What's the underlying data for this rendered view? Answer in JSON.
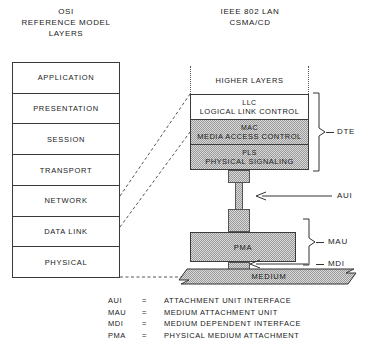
{
  "osi": {
    "title": "OSI\nREFERENCE MODEL\nLAYERS",
    "layers": [
      {
        "label": "APPLICATION"
      },
      {
        "label": "PRESENTATION"
      },
      {
        "label": "SESSION"
      },
      {
        "label": "TRANSPORT"
      },
      {
        "label": "NETWORK"
      },
      {
        "label": "DATA LINK"
      },
      {
        "label": "PHYSICAL"
      }
    ]
  },
  "ieee": {
    "title": "IEEE 802 LAN\nCSMA/CD",
    "higher_layers": "HIGHER LAYERS",
    "sublayers": [
      {
        "abbr": "LLC",
        "full": "LOGICAL LINK CONTROL",
        "shaded": false
      },
      {
        "abbr": "MAC",
        "full": "MEDIA ACCESS CONTROL",
        "shaded": true
      },
      {
        "abbr": "PLS",
        "full": "PHYSICAL SIGNALING",
        "shaded": true
      }
    ],
    "pma_label": "PMA",
    "medium_label": "MEDIUM"
  },
  "annotations": {
    "dte": "DTE",
    "aui": "AUI",
    "mau": "MAU",
    "mdi": "MDI"
  },
  "legend": {
    "equals": "=",
    "rows": [
      {
        "abbr": "AUI",
        "expansion": "ATTACHMENT UNIT INTERFACE"
      },
      {
        "abbr": "MAU",
        "expansion": "MEDIUM ATTACHMENT UNIT"
      },
      {
        "abbr": "MDI",
        "expansion": "MEDIUM DEPENDENT INTERFACE"
      },
      {
        "abbr": "PMA",
        "expansion": "PHYSICAL MEDIUM ATTACHMENT"
      }
    ]
  },
  "colors": {
    "line": "#3a3a3a",
    "text": "#1a1a1a",
    "shade": "#d9d9d9"
  }
}
